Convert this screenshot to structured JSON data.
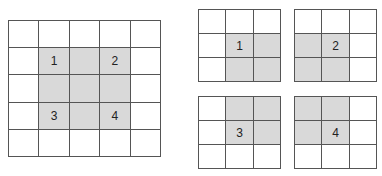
{
  "colors": {
    "line": "#555555",
    "shade": "#d9d9d9",
    "background": "#ffffff"
  },
  "main_grid": {
    "rows": 5,
    "cols": 5,
    "shaded": [
      [
        1,
        1
      ],
      [
        1,
        2
      ],
      [
        1,
        3
      ],
      [
        2,
        1
      ],
      [
        2,
        2
      ],
      [
        2,
        3
      ],
      [
        3,
        1
      ],
      [
        3,
        2
      ],
      [
        3,
        3
      ]
    ],
    "labels": [
      {
        "row": 1,
        "col": 1,
        "text": "1"
      },
      {
        "row": 1,
        "col": 3,
        "text": "2"
      },
      {
        "row": 3,
        "col": 1,
        "text": "3"
      },
      {
        "row": 3,
        "col": 3,
        "text": "4"
      }
    ]
  },
  "sub_grids": [
    {
      "id": "1",
      "rows": 3,
      "cols": 3,
      "shaded": [
        [
          1,
          1
        ],
        [
          1,
          2
        ],
        [
          2,
          1
        ],
        [
          2,
          2
        ]
      ],
      "label": {
        "row": 1,
        "col": 1,
        "text": "1"
      }
    },
    {
      "id": "2",
      "rows": 3,
      "cols": 3,
      "shaded": [
        [
          1,
          0
        ],
        [
          1,
          1
        ],
        [
          2,
          0
        ],
        [
          2,
          1
        ]
      ],
      "label": {
        "row": 1,
        "col": 1,
        "text": "2"
      }
    },
    {
      "id": "3",
      "rows": 3,
      "cols": 3,
      "shaded": [
        [
          0,
          1
        ],
        [
          0,
          2
        ],
        [
          1,
          1
        ],
        [
          1,
          2
        ]
      ],
      "label": {
        "row": 1,
        "col": 1,
        "text": "3"
      }
    },
    {
      "id": "4",
      "rows": 3,
      "cols": 3,
      "shaded": [
        [
          0,
          0
        ],
        [
          0,
          1
        ],
        [
          1,
          0
        ],
        [
          1,
          1
        ]
      ],
      "label": {
        "row": 1,
        "col": 1,
        "text": "4"
      }
    }
  ]
}
